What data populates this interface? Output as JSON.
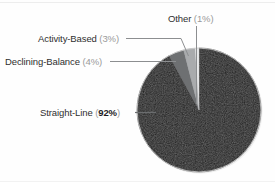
{
  "chart_data": {
    "type": "pie",
    "title": "",
    "subtitle": "",
    "xlabel": "",
    "ylabel": "",
    "legend_position": "none",
    "labels_position": "external-with-leader-lines",
    "categories": [
      "Straight-Line",
      "Declining-Balance",
      "Activity-Based",
      "Other"
    ],
    "values": [
      92,
      4,
      3,
      1
    ],
    "value_unit": "%",
    "total": 100,
    "start_angle_deg": 0,
    "direction": "counterclockwise",
    "slices": [
      {
        "name": "Straight-Line",
        "value": 92,
        "value_text": "92%",
        "emphasis": "bold",
        "color": "#1b1b1b"
      },
      {
        "name": "Declining-Balance",
        "value": 4,
        "value_text": "4%",
        "emphasis": "normal",
        "color": "#6e7072"
      },
      {
        "name": "Activity-Based",
        "value": 3,
        "value_text": "3%",
        "emphasis": "normal",
        "color": "#a9abad"
      },
      {
        "name": "Other",
        "value": 1,
        "value_text": "1%",
        "emphasis": "normal",
        "color": "#e8e9ea"
      }
    ]
  },
  "labels": {
    "other": {
      "name": "Other",
      "open_paren": "(",
      "value_text": "1%",
      "close_paren": ")"
    },
    "activity": {
      "name": "Activity-Based",
      "open_paren": "(",
      "value_text": "3%",
      "close_paren": ")"
    },
    "declining": {
      "name": "Declining-Balance",
      "open_paren": "(",
      "value_text": "4%",
      "close_paren": ")"
    },
    "straight": {
      "name": "Straight-Line",
      "open_paren": "(",
      "value_text": "92%",
      "close_paren": ")"
    }
  },
  "style": {
    "background": "#fefefe",
    "leader_line_color": "#8c8e90",
    "pie_outline_color": "#d8d8d8",
    "text_color": "#2f2f2f",
    "muted_text_color": "#9a9a9a"
  }
}
